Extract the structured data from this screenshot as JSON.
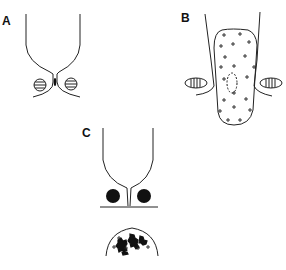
{
  "figure": {
    "panels": [
      {
        "id": "A",
        "label": "A",
        "description": "Narrow cell neck with two horizontally striped circular bodies and a small dark mark at the constriction"
      },
      {
        "id": "B",
        "label": "B",
        "description": "Elongated rounded body filled with plus signs and a dashed oval, flanked by two vertically striped elliptical bodies"
      },
      {
        "id": "C",
        "label": "C",
        "description": "Cell neck with two solid black circles; below, a dome-shaped region with dark irregular clusters and plus signs"
      }
    ],
    "colors": {
      "stroke": "#222222",
      "fill_dark": "#111111",
      "background": "#ffffff"
    }
  }
}
